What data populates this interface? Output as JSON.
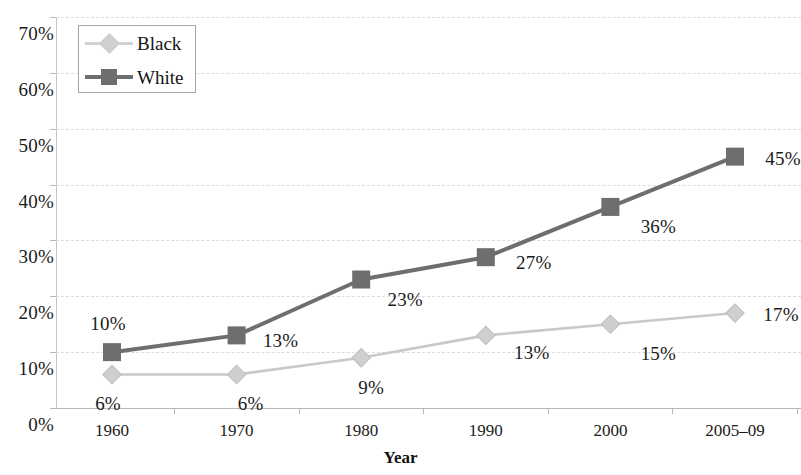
{
  "chart_data": {
    "type": "line",
    "title": "",
    "xlabel": "Year",
    "ylabel": "",
    "categories": [
      "1960",
      "1970",
      "1980",
      "1990",
      "2000",
      "2005–09"
    ],
    "ylim": [
      0,
      70
    ],
    "ytick_step": 10,
    "ytick_labels": [
      "0%",
      "10%",
      "20%",
      "30%",
      "40%",
      "50%",
      "60%",
      "70%"
    ],
    "ytick_values": [
      0,
      10,
      20,
      30,
      40,
      50,
      60,
      70
    ],
    "grid": true,
    "grid_style": "dashed",
    "legend_position": "top-left",
    "series": [
      {
        "name": "Black",
        "color": "#c9c9c9",
        "marker": "diamond",
        "values": [
          6,
          6,
          9,
          13,
          15,
          17
        ],
        "labels": [
          "6%",
          "6%",
          "9%",
          "13%",
          "15%",
          "17%"
        ]
      },
      {
        "name": "White",
        "color": "#6e6e6e",
        "marker": "square",
        "values": [
          10,
          13,
          23,
          27,
          36,
          45
        ],
        "labels": [
          "10%",
          "13%",
          "23%",
          "27%",
          "36%",
          "45%"
        ]
      }
    ]
  },
  "axis": {
    "x_title": "Year"
  },
  "legend": {
    "items": [
      {
        "label": "Black"
      },
      {
        "label": "White"
      }
    ]
  },
  "colors": {
    "black_series": "#c9c9c9",
    "white_series": "#6e6e6e",
    "gridline": "#dcdcdc",
    "text": "#1b1b1b",
    "background": "#ffffff"
  }
}
